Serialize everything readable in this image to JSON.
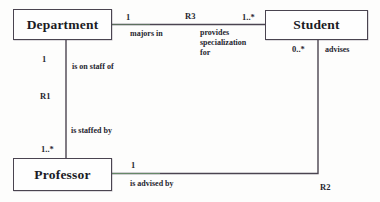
{
  "diagram": {
    "type": "entity-relationship-diagram",
    "entities": [
      {
        "id": "department",
        "label": "Department"
      },
      {
        "id": "student",
        "label": "Student"
      },
      {
        "id": "professor",
        "label": "Professor"
      }
    ],
    "relationships": [
      {
        "id": "R3",
        "name_label": "R3",
        "from": "Department",
        "to": "Student",
        "from_cardinality": "1",
        "to_cardinality": "1..*",
        "from_role": "majors in",
        "to_role": "provides\nspecialization\nfor"
      },
      {
        "id": "R1",
        "name_label": "R1",
        "from": "Department",
        "to": "Professor",
        "from_cardinality": "1",
        "to_cardinality": "1..*",
        "from_role": "is on staff of",
        "to_role": "is staffed by"
      },
      {
        "id": "R2",
        "name_label": "R2",
        "from": "Student",
        "to": "Professor",
        "from_cardinality": "0..*",
        "to_cardinality": "1",
        "from_role": "advises",
        "to_role": "is advised by"
      }
    ],
    "annotations": {
      "dept_to_student_card": "1",
      "dept_to_student_role": "majors in",
      "r3_label": "R3",
      "student_to_dept_card": "1..*",
      "student_to_dept_role_line1": "provides",
      "student_to_dept_role_line2": "specialization",
      "student_to_dept_role_line3": "for",
      "dept_to_prof_card": "1",
      "dept_to_prof_role": "is on staff of",
      "r1_label": "R1",
      "prof_to_dept_role": "is staffed by",
      "prof_to_dept_card": "1..*",
      "prof_to_student_card": "1",
      "prof_to_student_role": "is advised by",
      "student_to_prof_card": "0..*",
      "student_to_prof_role": "advises",
      "r2_label": "R2"
    },
    "colors": {
      "line": "#4a4450",
      "box_border": "#4a4450",
      "text": "#26262f",
      "background": "#fdfdfc",
      "fringe_green": "#7ec07a",
      "fringe_purple": "#7c4d82"
    }
  }
}
